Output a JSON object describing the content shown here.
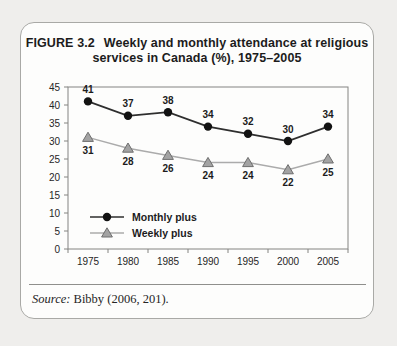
{
  "figure": {
    "label": "FIGURE 3.2",
    "title_line1": "Weekly and monthly attendance at religious",
    "title_line2": "services in Canada (%), 1975–2005"
  },
  "source": {
    "prefix": "Source:",
    "text": " Bibby (2006, 201)."
  },
  "colors": {
    "monthly_line": "#2e2e2e",
    "monthly_marker": "#121212",
    "weekly_line": "#ababab",
    "weekly_marker_fill": "#a3a3a3",
    "weekly_marker_stroke": "#6e6e6e",
    "plot_border": "#848481",
    "label_text": "#1c1c1c"
  },
  "chart_data": {
    "type": "line",
    "x": [
      "1975",
      "1980",
      "1985",
      "1990",
      "1995",
      "2000",
      "2005"
    ],
    "series": [
      {
        "name": "Monthly plus",
        "marker": "circle",
        "values": [
          41,
          37,
          38,
          34,
          32,
          30,
          34
        ]
      },
      {
        "name": "Weekly plus",
        "marker": "triangle",
        "values": [
          31,
          28,
          26,
          24,
          24,
          22,
          25
        ]
      }
    ],
    "xlabel": "",
    "ylabel": "",
    "ylim": [
      0,
      45
    ],
    "ytick_step": 5,
    "grid": false,
    "data_labels": true,
    "legend_position": "inside-lower-left"
  }
}
